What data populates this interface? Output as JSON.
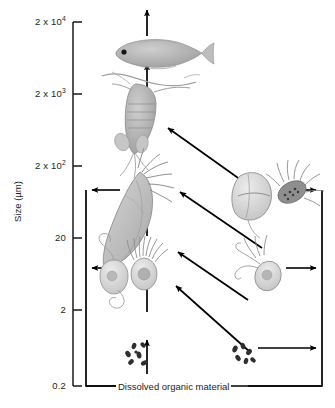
{
  "figure": {
    "axis": {
      "label": "Size (µm)",
      "ticks": [
        {
          "id": "t1",
          "text": "2 x 10",
          "exp": "4",
          "value": 20000,
          "y": 22
        },
        {
          "id": "t2",
          "text": "2 x 10",
          "exp": "3",
          "value": 2000,
          "y": 94
        },
        {
          "id": "t3",
          "text": "2 x 10",
          "exp": "2",
          "value": 200,
          "y": 166
        },
        {
          "id": "t4",
          "text": "20",
          "exp": "",
          "value": 20,
          "y": 238
        },
        {
          "id": "t5",
          "text": "2",
          "exp": "",
          "value": 2,
          "y": 310
        },
        {
          "id": "t6",
          "text": "0.2",
          "exp": "",
          "value": 0.2,
          "y": 386
        }
      ]
    },
    "bottom_label": "Dissolved organic material",
    "organisms": [
      {
        "id": "fish-larva",
        "name": "fish-larva",
        "size_band": "2 x 10⁴"
      },
      {
        "id": "copepod",
        "name": "copepod",
        "size_band": "2 x 10³"
      },
      {
        "id": "appendicularian",
        "name": "appendicularian",
        "size_band": "2 x 10³"
      },
      {
        "id": "tintinnid-ciliate",
        "name": "tintinnid-ciliate",
        "size_band": "2 x 10²"
      },
      {
        "id": "diatom",
        "name": "diatom",
        "size_band": "2 x 10²"
      },
      {
        "id": "ciliate",
        "name": "ciliate",
        "size_band": "20"
      },
      {
        "id": "heterotrophic-flagellate",
        "name": "heterotrophic-flagellate",
        "size_band": "20"
      },
      {
        "id": "dinoflagellate",
        "name": "dinoflagellate",
        "size_band": "20"
      },
      {
        "id": "nanoflagellate",
        "name": "nanoflagellate",
        "size_band": "2"
      },
      {
        "id": "bacteria-left",
        "name": "bacteria",
        "size_band": "0.2"
      },
      {
        "id": "bacteria-right",
        "name": "bacteria",
        "size_band": "0.2"
      }
    ],
    "colors": {
      "line": "#000000",
      "axis": "#1a1a1a",
      "organism_fill": "#b5b5b5",
      "organism_fill_light": "#d8d8d8",
      "organism_stroke": "#8a8a8a",
      "background": "#ffffff"
    }
  }
}
